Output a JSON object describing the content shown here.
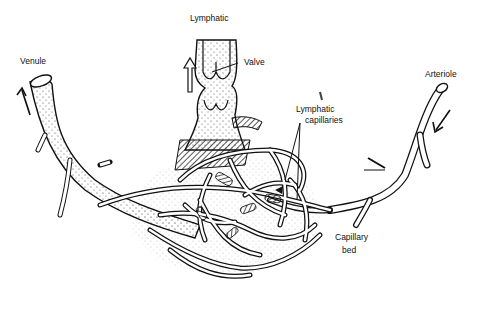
{
  "figure": {
    "type": "diagram",
    "labels": {
      "lymphatic": "Lymphatic",
      "valve": "Valve",
      "venule": "Venule",
      "arteriole": "Arteriole",
      "lymphatic_capillaries_line1": "Lymphatic",
      "lymphatic_capillaries_line2": "capillaries",
      "capillary_bed_line1": "Capillary",
      "capillary_bed_line2": "bed"
    },
    "colors": {
      "line": "#111111",
      "background": "#ffffff",
      "stipple": "#555555"
    }
  }
}
